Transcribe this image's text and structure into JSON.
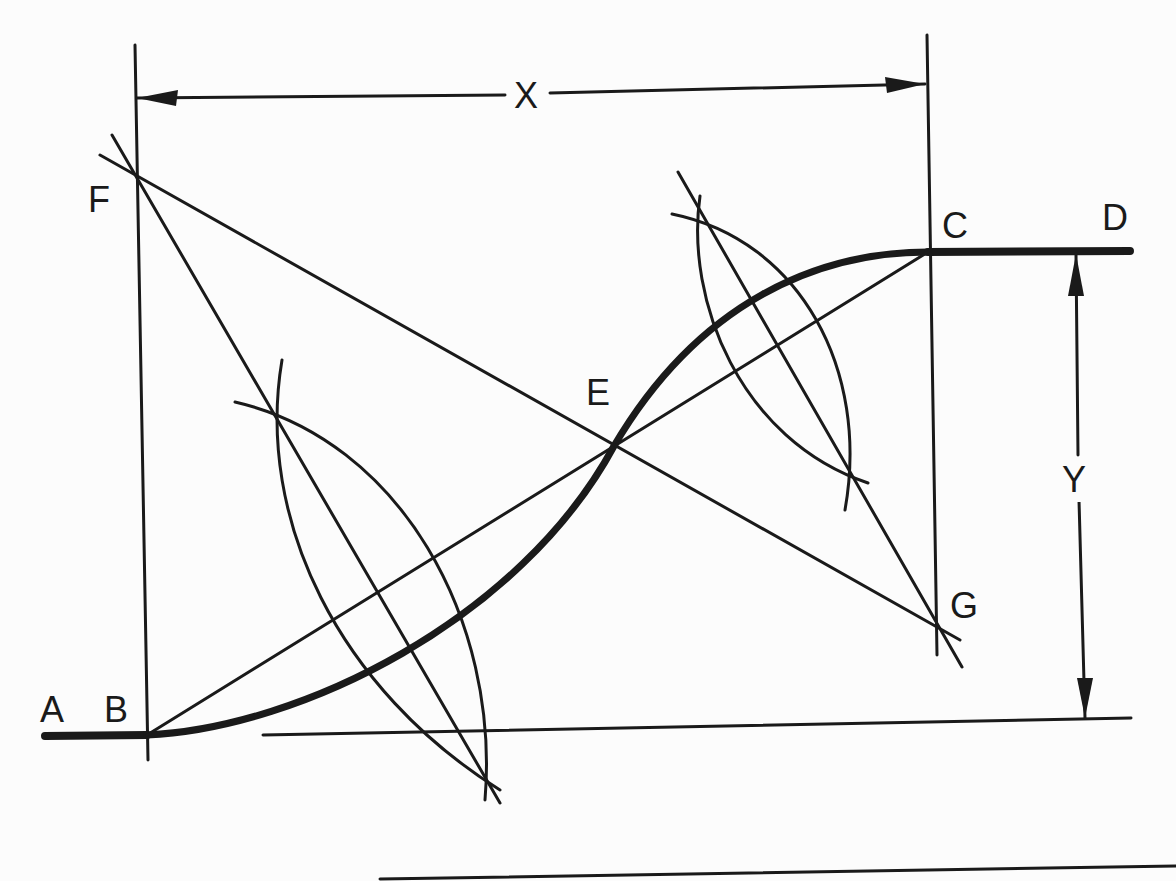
{
  "diagram": {
    "type": "reverse-curve-construction",
    "ink_color": "#1a1a1a",
    "background_color": "#fcfcfc",
    "points": {
      "A": {
        "label": "A",
        "x": 45,
        "y": 735
      },
      "B": {
        "label": "B",
        "x": 147,
        "y": 735
      },
      "C": {
        "label": "C",
        "x": 928,
        "y": 252
      },
      "D": {
        "label": "D",
        "x": 1130,
        "y": 252
      },
      "E": {
        "label": "E",
        "x": 614,
        "y": 446
      },
      "F": {
        "label": "F",
        "x": 137,
        "y": 177
      },
      "G": {
        "label": "G",
        "x": 936,
        "y": 627
      }
    },
    "dimensions": {
      "x": {
        "label": "X",
        "from": "B-vertical",
        "to": "C-vertical"
      },
      "y": {
        "label": "Y",
        "from": "line-CD",
        "to": "baseline"
      }
    }
  }
}
